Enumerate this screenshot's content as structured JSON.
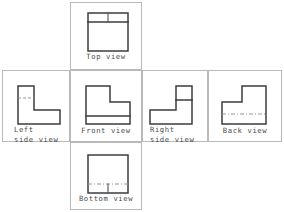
{
  "diagram": {
    "stroke_colors": {
      "frame": "#b9b9b9",
      "object_outline": "#3c3c3c",
      "hidden_line": "#8d8d8d",
      "label_text": "#4a4a4a"
    },
    "layout": {
      "arrangement": "unfolded-box cross",
      "row_band_top_y": 70,
      "row_band_bottom_y": 142,
      "center_column_x": [
        70,
        142
      ]
    }
  },
  "views": [
    {
      "id": "top",
      "data_name": "view-top",
      "label": "Top view",
      "label_lines": [
        "Top view"
      ],
      "position": "above-front",
      "shape": "square-with-step-edge",
      "frame": {
        "x": 70,
        "y": 2,
        "w": 72,
        "h": 68
      },
      "art": {
        "x": 88,
        "y": 14,
        "w": 40,
        "h": 38
      },
      "features": [
        "outer square",
        "horizontal step line near top",
        "vertical division line in upper band"
      ]
    },
    {
      "id": "front",
      "data_name": "view-front",
      "label": "Front view",
      "label_lines": [
        "Front view"
      ],
      "position": "center",
      "shape": "L-shape-upright-left",
      "frame": {
        "x": 70,
        "y": 70,
        "w": 72,
        "h": 72
      },
      "art": {
        "x": 86,
        "y": 86,
        "w": 44,
        "h": 38
      },
      "features": [
        "L profile with tall leg on left",
        "horizontal line above base"
      ]
    },
    {
      "id": "left",
      "data_name": "view-left-side",
      "label": "Left side view",
      "label_lines": [
        "Left",
        "side  view"
      ],
      "position": "left-of-front",
      "shape": "L-shape-upright-left",
      "frame": {
        "x": 2,
        "y": 70,
        "w": 68,
        "h": 72
      },
      "art": {
        "x": 18,
        "y": 86,
        "w": 42,
        "h": 38
      },
      "features": [
        "L profile with tall leg on left",
        "hidden dashed line across upright leg"
      ]
    },
    {
      "id": "right",
      "data_name": "view-right-side",
      "label": "Right side view",
      "label_lines": [
        "Right",
        "side  view"
      ],
      "position": "right-of-front",
      "shape": "L-shape-upright-right",
      "frame": {
        "x": 142,
        "y": 70,
        "w": 66,
        "h": 72
      },
      "art": {
        "x": 157,
        "y": 86,
        "w": 42,
        "h": 38
      },
      "features": [
        "mirrored L profile with tall leg on right",
        "horizontal line splitting upright leg"
      ]
    },
    {
      "id": "back",
      "data_name": "view-back",
      "label": "Back view",
      "label_lines": [
        "Back view"
      ],
      "position": "far-right",
      "shape": "L-shape-upright-right",
      "frame": {
        "x": 208,
        "y": 70,
        "w": 74,
        "h": 72
      },
      "art": {
        "x": 224,
        "y": 86,
        "w": 44,
        "h": 38
      },
      "features": [
        "mirrored L profile with tall leg on right",
        "hidden dashed line across base"
      ]
    },
    {
      "id": "bottom",
      "data_name": "view-bottom",
      "label": "Bottom view",
      "label_lines": [
        "Bottom view"
      ],
      "position": "below-front",
      "shape": "square-with-hidden-step",
      "frame": {
        "x": 70,
        "y": 142,
        "w": 72,
        "h": 68
      },
      "art": {
        "x": 88,
        "y": 155,
        "w": 40,
        "h": 38
      },
      "features": [
        "outer square",
        "hidden dashed horizontal line near bottom",
        "short vertical tick on dashed line"
      ]
    }
  ]
}
